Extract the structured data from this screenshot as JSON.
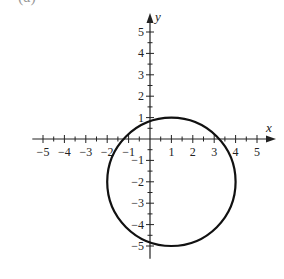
{
  "part_label": "(a)",
  "chart_data": {
    "type": "line",
    "title": "",
    "xlabel": "x",
    "ylabel": "y",
    "xlim": [
      -5.5,
      5.7
    ],
    "ylim": [
      -5.6,
      5.7
    ],
    "grid": false,
    "x_tick_labels": [
      "-5",
      "-4",
      "-3",
      "-2",
      "-1",
      "1",
      "2",
      "3",
      "4",
      "5"
    ],
    "y_tick_labels": [
      "5",
      "4",
      "3",
      "2",
      "1",
      "-1",
      "-2",
      "-3",
      "-4",
      "-5"
    ],
    "minor_ticks_per_unit": 2,
    "series": [
      {
        "name": "circle",
        "shape": "circle",
        "center": [
          1,
          -2
        ],
        "radius": 3,
        "equation": "(x-1)^2 + (y+2)^2 = 9",
        "x_intercepts": [
          -1.24,
          3.24
        ],
        "y_intercepts": [
          0.83,
          -4.83
        ],
        "color": "#111111"
      }
    ]
  }
}
